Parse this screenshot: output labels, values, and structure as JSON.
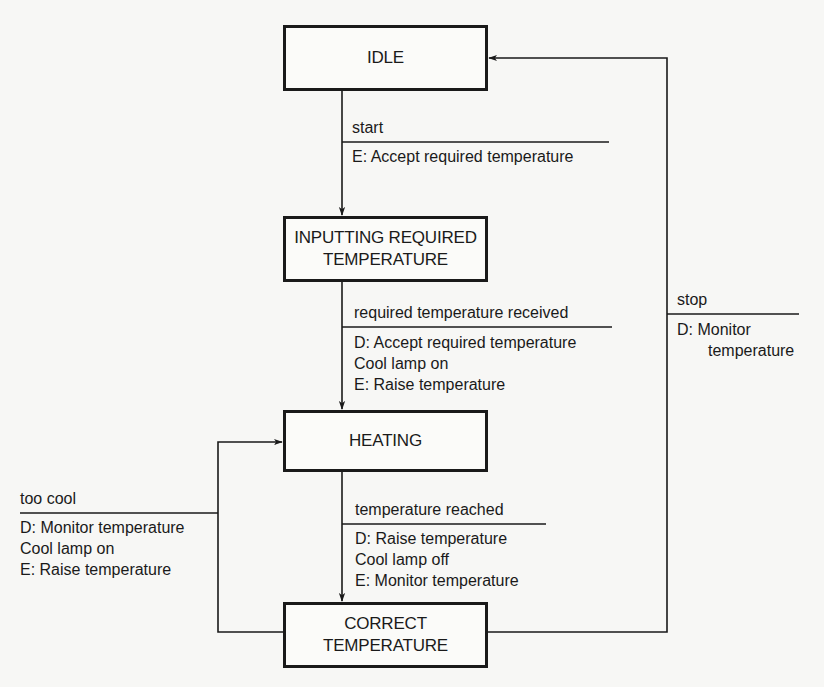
{
  "diagram": {
    "type": "state-transition-diagram",
    "states": [
      {
        "id": "idle",
        "label": "IDLE"
      },
      {
        "id": "inputting",
        "label": "INPUTTING REQUIRED\nTEMPERATURE"
      },
      {
        "id": "heating",
        "label": "HEATING"
      },
      {
        "id": "correct",
        "label": "CORRECT\nTEMPERATURE"
      }
    ],
    "transitions": [
      {
        "id": "start",
        "from": "idle",
        "to": "inputting",
        "event": "start",
        "actions": [
          "E: Accept required temperature"
        ]
      },
      {
        "id": "required-received",
        "from": "inputting",
        "to": "heating",
        "event": "required temperature received",
        "actions": [
          "D: Accept required temperature",
          "Cool lamp on",
          "E: Raise temperature"
        ]
      },
      {
        "id": "temperature-reached",
        "from": "heating",
        "to": "correct",
        "event": "temperature reached",
        "actions": [
          "D: Raise temperature",
          "Cool lamp off",
          "E: Monitor temperature"
        ]
      },
      {
        "id": "too-cool",
        "from": "correct",
        "to": "heating",
        "event": "too cool",
        "actions": [
          "D: Monitor temperature",
          "Cool lamp on",
          "E: Raise temperature"
        ]
      },
      {
        "id": "stop",
        "from": "correct",
        "to": "idle",
        "event": "stop",
        "actions": [
          "D: Monitor",
          "temperature"
        ]
      }
    ],
    "colors": {
      "ink": "#1a1a1a",
      "background": "#f7f7f5"
    }
  }
}
